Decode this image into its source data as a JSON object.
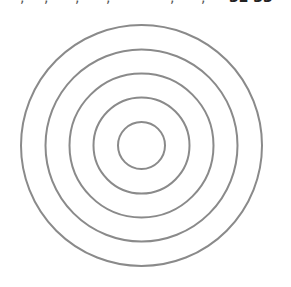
{
  "figure": {
    "type": "concentric-circles",
    "center": {
      "x": 141.5,
      "y": 145.5
    },
    "stroke_color": "#8a8a8a",
    "stroke_width": 2,
    "rings": [
      {
        "r": 120.5
      },
      {
        "r": 96
      },
      {
        "r": 72
      },
      {
        "r": 48
      },
      {
        "r": 23.5
      }
    ]
  },
  "clipped_text_top": {
    "fragments": [
      ",",
      ",",
      ",",
      ",",
      ",",
      ",",
      "32 33"
    ]
  }
}
